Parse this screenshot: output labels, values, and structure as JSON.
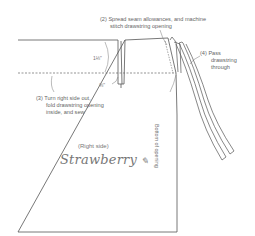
{
  "diagram": {
    "type": "sewing-instructions",
    "steps": {
      "step2": {
        "line1": "(2) Spread seam allowances, and machine",
        "line2": "stitch drawstring opening"
      },
      "step3": {
        "line1": "(3) Turn right side out,",
        "line2": "fold drawstring opening",
        "line3": "inside, and sew"
      },
      "step4": {
        "line1": "(4) Pass",
        "line2": "drawstring",
        "line3": "through"
      }
    },
    "dimensions": {
      "top_height": "1⅛\"",
      "opening_width": "⅜\""
    },
    "labels": {
      "bottom_of_opening": "Bottom of opening",
      "right_side": "(Right side)",
      "brand_signature": "Strawberry"
    },
    "colors": {
      "line": "#555555",
      "text": "#666666",
      "background": "#ffffff"
    }
  }
}
